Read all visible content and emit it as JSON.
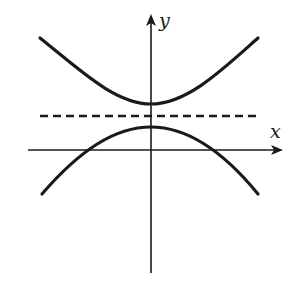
{
  "diagram": {
    "colors": {
      "stroke": "#1a1a1a",
      "background": "#ffffff"
    },
    "axes": {
      "x_label": "x",
      "y_label": "y"
    },
    "elements": [
      {
        "id": "upper-curve",
        "type": "curve",
        "shape": "opens-upward",
        "vertex_on_y_axis": true,
        "above_dashed_line": true
      },
      {
        "id": "dashed-line",
        "type": "horizontal-dashed-line",
        "position": "between curves, above x-axis"
      },
      {
        "id": "lower-curve",
        "type": "curve",
        "shape": "opens-downward",
        "vertex_on_y_axis": true,
        "crosses_x_axis_twice": true
      }
    ]
  }
}
